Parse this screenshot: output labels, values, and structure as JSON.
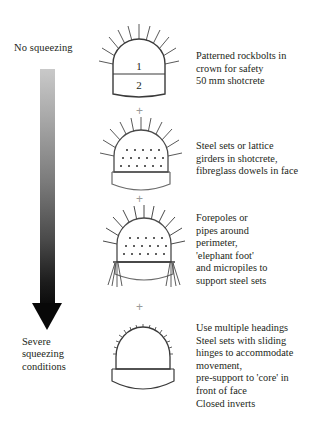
{
  "diagram": {
    "axis": {
      "top_label": "No squeezing",
      "bottom_label_lines": [
        "Severe",
        "squeezing",
        "conditions"
      ],
      "gradient_from": "#c9c9c9",
      "gradient_to": "#0a0a0a"
    },
    "plus_symbol": "+",
    "stages": [
      {
        "id": "stage-1",
        "figure_name": "tunnel-section-rockbolts",
        "zone_labels": [
          "1",
          "2"
        ],
        "description_lines": [
          "Patterned rockbolts in",
          "crown for safety",
          "50 mm shotcrete"
        ]
      },
      {
        "id": "stage-2",
        "figure_name": "tunnel-section-steel-sets-dowels",
        "zone_labels": [],
        "description_lines": [
          "Steel sets or lattice",
          "girders in shotcrete,",
          "fibreglass dowels in face"
        ]
      },
      {
        "id": "stage-3",
        "figure_name": "tunnel-section-forepoles-micropiles",
        "zone_labels": [],
        "description_lines": [
          "Forepoles or",
          "pipes around",
          "perimeter,",
          "'elephant foot'",
          "and micropiles to",
          "support steel sets"
        ]
      },
      {
        "id": "stage-4",
        "figure_name": "tunnel-section-closed-invert",
        "zone_labels": [],
        "description_lines": [
          "Use multiple headings",
          "Steel sets with sliding",
          "hinges to accommodate",
          "movement,",
          "pre-support to 'core' in",
          "front of face",
          "Closed inverts"
        ]
      }
    ]
  }
}
